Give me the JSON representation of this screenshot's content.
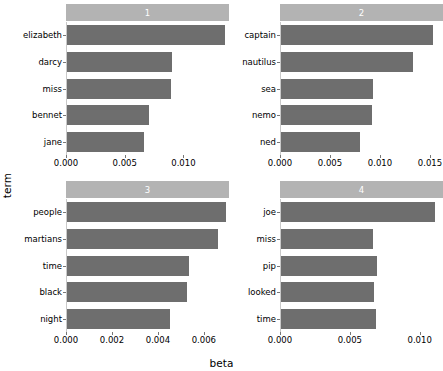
{
  "chart_data": {
    "type": "bar",
    "orientation": "horizontal",
    "title": "",
    "xlabel": "beta",
    "ylabel": "term",
    "grid": false,
    "legend": false,
    "facets": [
      {
        "strip_label": "1",
        "xlim": [
          0,
          0.0138
        ],
        "xticks": [
          "0.000",
          "0.005",
          "0.010"
        ],
        "xtick_values": [
          0.0,
          0.005,
          0.01
        ],
        "categories": [
          "elizabeth",
          "darcy",
          "miss",
          "bennet",
          "jane"
        ],
        "values": [
          0.01345,
          0.00893,
          0.00887,
          0.007,
          0.00659
        ]
      },
      {
        "strip_label": "2",
        "xlim": [
          0,
          0.0162
        ],
        "xticks": [
          "0.000",
          "0.005",
          "0.010",
          "0.015"
        ],
        "xtick_values": [
          0.0,
          0.005,
          0.01,
          0.015
        ],
        "categories": [
          "captain",
          "nautilus",
          "sea",
          "nemo",
          "ned"
        ],
        "values": [
          0.01524,
          0.01317,
          0.00918,
          0.00908,
          0.00789
        ]
      },
      {
        "strip_label": "3",
        "xlim": [
          0,
          0.00705
        ],
        "xticks": [
          "0.000",
          "0.002",
          "0.004",
          "0.006"
        ],
        "xtick_values": [
          0.0,
          0.002,
          0.004,
          0.006
        ],
        "categories": [
          "people",
          "martians",
          "time",
          "black",
          "night"
        ],
        "values": [
          0.0069,
          0.00659,
          0.00532,
          0.00523,
          0.00449
        ]
      },
      {
        "strip_label": "4",
        "xlim": [
          0,
          0.0116
        ],
        "xticks": [
          "0.000",
          "0.005",
          "0.010",
          "0.015"
        ],
        "xtick_values": [
          0.0,
          0.005,
          0.01,
          0.015
        ],
        "categories": [
          "joe",
          "miss",
          "pip",
          "looked",
          "time"
        ],
        "values": [
          0.011,
          0.00659,
          0.0069,
          0.00663,
          0.0068
        ]
      }
    ],
    "colors": {
      "bar": "#6e6e6e",
      "strip_background": "#b3b3b3",
      "strip_text": "#ffffff",
      "panel_background": "#ffffff",
      "axis_text": "#000000"
    }
  }
}
